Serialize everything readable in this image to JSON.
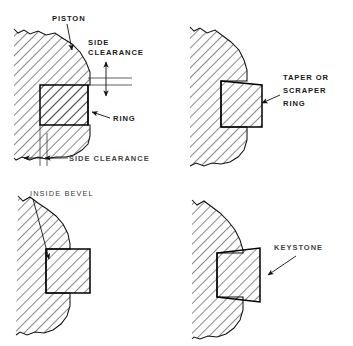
{
  "figure": {
    "background_color": "#ffffff",
    "line_color": "#111111",
    "text_color": "#1a1a1a"
  },
  "panels": [
    {
      "id": "panel-rectangular-ring",
      "position": "top-left",
      "labels": [
        {
          "name": "piston-label",
          "text": "PISTON"
        },
        {
          "name": "side-clearance-top-label-line1",
          "text": "SIDE"
        },
        {
          "name": "side-clearance-top-label-line2",
          "text": "CLEARANCE"
        },
        {
          "name": "ring-label",
          "text": "RING"
        },
        {
          "name": "side-clearance-bottom-label",
          "text": "SIDE CLEARANCE"
        }
      ]
    },
    {
      "id": "panel-taper-scraper-ring",
      "position": "top-right",
      "labels": [
        {
          "name": "taper-ring-label-line1",
          "text": "TAPER OR"
        },
        {
          "name": "taper-ring-label-line2",
          "text": "SCRAPER"
        },
        {
          "name": "taper-ring-label-line3",
          "text": "RING"
        }
      ]
    },
    {
      "id": "panel-inside-bevel-ring",
      "position": "bottom-left",
      "labels": [
        {
          "name": "inside-bevel-label",
          "text": "INSIDE BEVEL"
        }
      ]
    },
    {
      "id": "panel-keystone-ring",
      "position": "bottom-right",
      "labels": [
        {
          "name": "keystone-label",
          "text": "KEYSTONE"
        }
      ]
    }
  ],
  "text": {
    "piston": "PISTON",
    "side": "SIDE",
    "clearance": "CLEARANCE",
    "ring": "RING",
    "side_clearance": "SIDE CLEARANCE",
    "taper_or": "TAPER OR",
    "scraper": "SCRAPER",
    "taper_ring": "RING",
    "inside_bevel": "INSIDE BEVEL",
    "keystone": "KEYSTONE"
  }
}
